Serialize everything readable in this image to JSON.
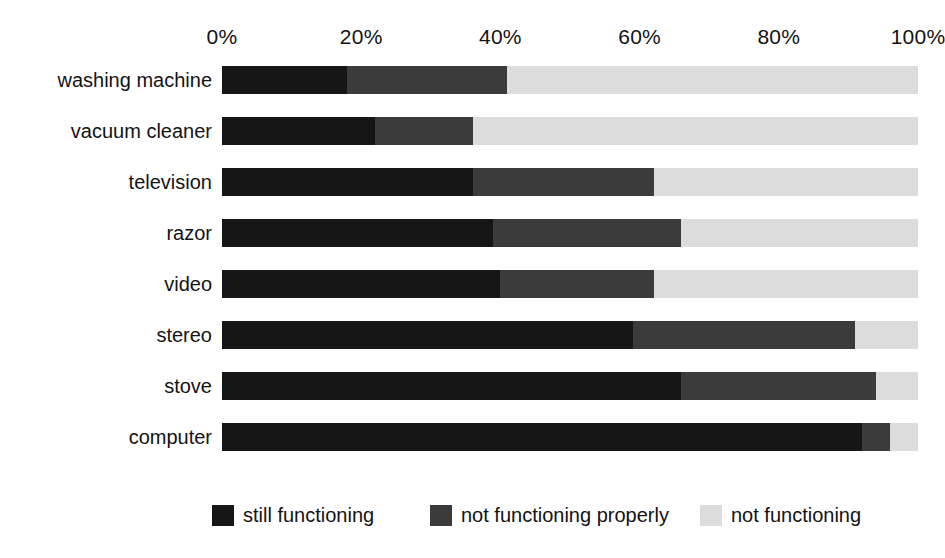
{
  "chart_data": {
    "type": "bar",
    "subtype": "stacked-horizontal-percent",
    "title": "",
    "subtitle": "",
    "xlabel": "",
    "ylabel": "",
    "xlim": [
      0,
      100
    ],
    "grid": false,
    "legend_position": "bottom",
    "axis": {
      "tick_labels": [
        "0%",
        "20%",
        "40%",
        "60%",
        "80%",
        "100%"
      ],
      "tick_values": [
        0,
        20,
        40,
        60,
        80,
        100
      ]
    },
    "categories": [
      "washing machine",
      "vacuum cleaner",
      "television",
      "razor",
      "video",
      "stereo",
      "stove",
      "computer"
    ],
    "series": [
      {
        "name": "still functioning",
        "color": "#161616",
        "values": [
          18,
          22,
          36,
          39,
          40,
          59,
          66,
          92
        ]
      },
      {
        "name": "not functioning properly",
        "color": "#3b3b3b",
        "values": [
          23,
          14,
          26,
          27,
          22,
          32,
          28,
          4
        ]
      },
      {
        "name": "not functioning",
        "color": "#dcdcdc",
        "values": [
          59,
          64,
          38,
          34,
          38,
          9,
          6,
          4
        ]
      }
    ]
  },
  "legend": {
    "entries": [
      {
        "label": "still functioning",
        "color": "#161616"
      },
      {
        "label": "not functioning properly",
        "color": "#3b3b3b"
      },
      {
        "label": "not functioning",
        "color": "#dcdcdc"
      }
    ]
  }
}
